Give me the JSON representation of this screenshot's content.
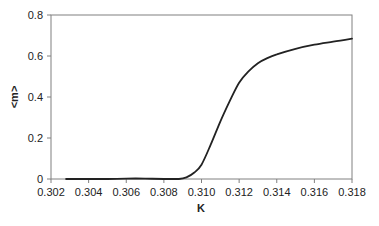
{
  "chart_data": {
    "type": "line",
    "title": "",
    "xlabel": "K",
    "ylabel": "<m>",
    "xlim": [
      0.302,
      0.318
    ],
    "ylim": [
      0,
      0.8
    ],
    "xticks": [
      "0.302",
      "0.304",
      "0.306",
      "0.308",
      "0.310",
      "0.312",
      "0.314",
      "0.316",
      "0.318"
    ],
    "yticks": [
      "0",
      "0.2",
      "0.4",
      "0.6",
      "0.8"
    ],
    "grid": false,
    "legend": null,
    "series": [
      {
        "name": "<m>",
        "color": "#222222",
        "x": [
          0.3028,
          0.304,
          0.305,
          0.306,
          0.307,
          0.308,
          0.3088,
          0.3092,
          0.3096,
          0.31,
          0.3105,
          0.311,
          0.3115,
          0.312,
          0.3125,
          0.313,
          0.3135,
          0.314,
          0.315,
          0.316,
          0.317,
          0.318
        ],
        "y": [
          0.0,
          0.0,
          0.0,
          0.002,
          0.002,
          0.0,
          0.0,
          0.008,
          0.03,
          0.07,
          0.17,
          0.28,
          0.38,
          0.47,
          0.525,
          0.565,
          0.59,
          0.608,
          0.635,
          0.655,
          0.67,
          0.685
        ]
      }
    ]
  }
}
